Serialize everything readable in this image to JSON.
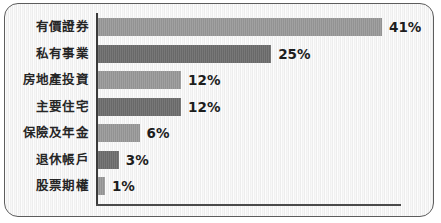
{
  "chart_data": {
    "type": "bar",
    "orientation": "horizontal",
    "title": "",
    "xlabel": "",
    "ylabel": "",
    "grid": false,
    "legend": "none",
    "xlim": [
      0,
      41
    ],
    "categories": [
      "有價證券",
      "私有事業",
      "房地產投資",
      "主要住宅",
      "保險及年金",
      "退休帳戶",
      "股票期權"
    ],
    "values": [
      41,
      25,
      12,
      12,
      6,
      3,
      1
    ],
    "value_labels": [
      "41%",
      "25%",
      "12%",
      "12%",
      "6%",
      "3%",
      "1%"
    ],
    "bar_colors": [
      "#9a9a9a",
      "#6e6e6e",
      "#9a9a9a",
      "#6e6e6e",
      "#9a9a9a",
      "#6e6e6e",
      "#9a9a9a"
    ],
    "bars": [
      {
        "category": "有價證券",
        "value": 41,
        "label": "41%",
        "shade": "light"
      },
      {
        "category": "私有事業",
        "value": 25,
        "label": "25%",
        "shade": "dark"
      },
      {
        "category": "房地產投資",
        "value": 12,
        "label": "12%",
        "shade": "light"
      },
      {
        "category": "主要住宅",
        "value": 12,
        "label": "12%",
        "shade": "dark"
      },
      {
        "category": "保險及年金",
        "value": 6,
        "label": "6%",
        "shade": "light"
      },
      {
        "category": "退休帳戶",
        "value": 3,
        "label": "3%",
        "shade": "dark"
      },
      {
        "category": "股票期權",
        "value": 1,
        "label": "1%",
        "shade": "light"
      }
    ]
  },
  "style": {
    "frame_border_color": "#5d5d5d",
    "background_color": "#f7f7f7",
    "axis_color": "#3a3a3a",
    "label_text_color": "#262626",
    "value_text_color": "#1d1d1d"
  }
}
